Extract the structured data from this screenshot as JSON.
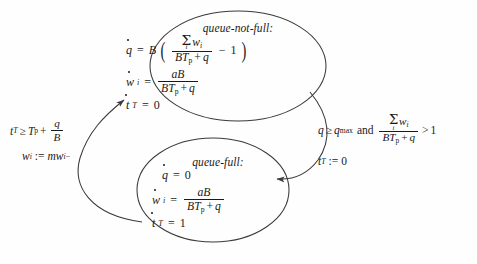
{
  "diagram": {
    "type": "hybrid-automaton-state-diagram",
    "background_color": "#fefefe",
    "stroke_color": "#3a3a3a",
    "text_color": "#1a1a1a",
    "states": [
      {
        "id": "queue-not-full",
        "name": "queue-not-full:",
        "position": "top",
        "equations": [
          {
            "id": "qdot",
            "lhs_var": "q",
            "lhs_dot": true,
            "rel": "=",
            "rhs_text": "B( (sum_i w_i)/(B T_p + q) - 1 )",
            "coef": "B",
            "num": "sum_i w_i",
            "den": "B T_p + q",
            "tail": "- 1"
          },
          {
            "id": "widot",
            "lhs_var": "w",
            "lhs_sub": "i",
            "lhs_dot": true,
            "rel": "=",
            "rhs_text": "aB/(B T_p + q)",
            "num": "aB",
            "den": "B T_p + q"
          },
          {
            "id": "tTdot",
            "lhs_var": "t",
            "lhs_sub": "T",
            "lhs_dot": true,
            "rel": "=",
            "rhs_text": "0",
            "value": "0"
          }
        ]
      },
      {
        "id": "queue-full",
        "name": "queue-full:",
        "position": "bottom",
        "equations": [
          {
            "id": "qdot",
            "lhs_var": "q",
            "lhs_dot": true,
            "rel": "=",
            "rhs_text": "0",
            "value": "0"
          },
          {
            "id": "widot",
            "lhs_var": "w",
            "lhs_sub": "i",
            "lhs_dot": true,
            "rel": "=",
            "rhs_text": "aB/(B T_p + q)",
            "num": "aB",
            "den": "B T_p + q"
          },
          {
            "id": "tTdot",
            "lhs_var": "t",
            "lhs_sub": "T",
            "lhs_dot": true,
            "rel": "=",
            "rhs_text": "1",
            "value": "1"
          }
        ]
      }
    ],
    "transitions": [
      {
        "id": "full-to-not-full",
        "from": "queue-full",
        "to": "queue-not-full",
        "side": "left",
        "arrowhead": "up",
        "guard_text": "t_T >= T_p + q/B",
        "guard_lhs": "t",
        "guard_lhs_sub": "T",
        "guard_rel": "≥",
        "guard_rhs_lead": "T",
        "guard_rhs_lead_sub": "p",
        "guard_plus": "+",
        "guard_frac_num": "q",
        "guard_frac_den": "B",
        "reset_text": "w_i := m w_i^-",
        "reset_lhs": "w",
        "reset_lhs_sub": "i",
        "reset_op": ":=",
        "reset_rhs": "m w",
        "reset_rhs_sub": "i",
        "reset_rhs_sup": "−"
      },
      {
        "id": "not-full-to-full",
        "from": "queue-not-full",
        "to": "queue-full",
        "side": "right",
        "arrowhead": "down",
        "guard_text": "q >= q_max and (sum_i w_i)/(B T_p + q) > 1",
        "guard_lhs": "q",
        "guard_rel": "≥",
        "guard_rhs": "q",
        "guard_rhs_sub": "max",
        "guard_conj": "and",
        "guard_frac_num": "sum_i w_i",
        "guard_frac_den": "B T_p + q",
        "guard_rel2": ">",
        "guard_rhs2": "1",
        "reset_text": "t_T := 0",
        "reset_lhs": "t",
        "reset_lhs_sub": "T",
        "reset_op": ":=",
        "reset_rhs": "0"
      }
    ],
    "symbols": {
      "sigma": "Σ",
      "geq": "≥",
      "gt": ">",
      "eq": "=",
      "assign": ":=",
      "plus": "+",
      "minus": "−",
      "and": "and",
      "B": "B",
      "a": "a",
      "q": "q",
      "w": "w",
      "t": "t",
      "T": "T",
      "m": "m",
      "i": "i",
      "p": "p",
      "max": "max",
      "one": "1",
      "zero": "0"
    }
  }
}
